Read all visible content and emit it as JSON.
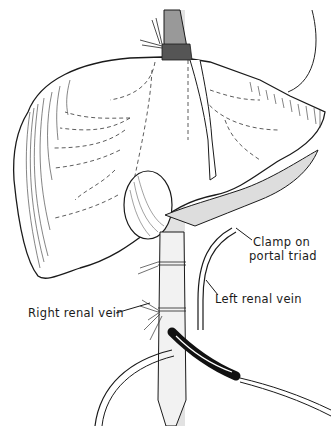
{
  "figure": {
    "labels": {
      "clamp_line1": "Clamp on",
      "clamp_line2": "portal triad",
      "left_renal_vein": "Left renal vein",
      "right_renal_vein": "Right renal vein"
    },
    "colors": {
      "ink": "#1a1a1a",
      "shaded_band": "#d9d9d9",
      "background": "#ffffff",
      "catheter": "#111111"
    }
  }
}
